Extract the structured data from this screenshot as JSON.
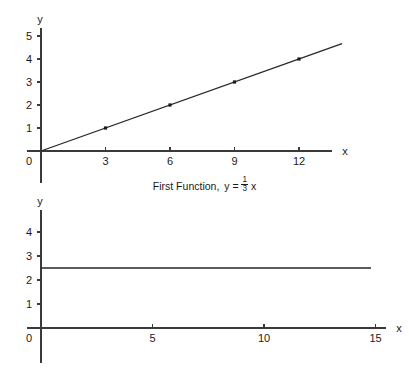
{
  "figure": {
    "background_color": "#ffffff",
    "ink_color": "#1a1a1a",
    "axis_color": "#3a3a3a"
  },
  "chart_data": [
    {
      "id": "first-function",
      "type": "line",
      "title": "",
      "caption_prefix": "First Function,",
      "caption_variable": "y",
      "caption_equals": "=",
      "caption_numerator": "1",
      "caption_denominator": "3",
      "caption_suffix": "x",
      "caption_full": "First Function, y = 1/3 x",
      "xlabel": "x",
      "ylabel": "y",
      "origin_label": "0",
      "xlim": [
        0,
        14
      ],
      "ylim": [
        0,
        5.4
      ],
      "xticks": [
        3,
        6,
        9,
        12
      ],
      "xtick_labels": [
        "3",
        "6",
        "9",
        "12"
      ],
      "yticks": [
        1,
        2,
        3,
        4,
        5
      ],
      "ytick_labels": [
        "1",
        "2",
        "3",
        "4",
        "5"
      ],
      "grid": false,
      "legend": false,
      "slope": 0.3333,
      "intercept": 0,
      "line_x_start": 0,
      "line_x_end": 14,
      "points": [
        {
          "x": 0,
          "y": 0
        },
        {
          "x": 3,
          "y": 1
        },
        {
          "x": 6,
          "y": 2
        },
        {
          "x": 9,
          "y": 3
        },
        {
          "x": 12,
          "y": 4
        }
      ],
      "marked_points": [
        {
          "x": 3,
          "y": 1
        },
        {
          "x": 6,
          "y": 2
        },
        {
          "x": 9,
          "y": 3
        },
        {
          "x": 12,
          "y": 4
        }
      ]
    },
    {
      "id": "second-function",
      "type": "line",
      "title": "",
      "caption_prefix": "Second Function,",
      "caption_variable": "y",
      "caption_equals": "=",
      "caption_whole": "2",
      "caption_numerator": "1",
      "caption_denominator": "2",
      "caption_full": "Second Function, y = 2 1/2",
      "xlabel": "x",
      "ylabel": "y",
      "origin_label": "0",
      "xlim": [
        0,
        16
      ],
      "ylim": [
        0,
        4.8
      ],
      "xticks": [
        5,
        10,
        15
      ],
      "xtick_labels": [
        "5",
        "10",
        "15"
      ],
      "yticks": [
        1,
        2,
        3,
        4
      ],
      "ytick_labels": [
        "1",
        "2",
        "3",
        "4"
      ],
      "grid": false,
      "legend": false,
      "constant_value": 2.5,
      "line_x_start": 0,
      "line_x_end": 14.8,
      "points": [
        {
          "x": 0,
          "y": 2.5
        },
        {
          "x": 14.8,
          "y": 2.5
        }
      ],
      "marked_points": []
    }
  ]
}
